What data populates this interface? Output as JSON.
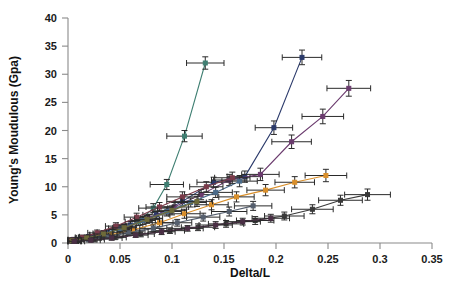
{
  "chart_data": {
    "type": "line",
    "title": "",
    "xlabel": "Delta/L",
    "ylabel": "Young's Moudulous (Gpa)",
    "xlim": [
      0,
      0.35
    ],
    "ylim": [
      0,
      40
    ],
    "xticks": [
      "0",
      "0.05",
      "0.1",
      "0.15",
      "0.2",
      "0.25",
      "0.3",
      "0.35"
    ],
    "xtick_values": [
      0,
      0.05,
      0.1,
      0.15,
      0.2,
      0.25,
      0.3,
      0.35
    ],
    "yticks": [
      "0",
      "5",
      "10",
      "15",
      "20",
      "25",
      "30",
      "35",
      "40"
    ],
    "ytick_values": [
      0,
      5,
      10,
      15,
      20,
      25,
      30,
      35,
      40
    ],
    "grid": false,
    "legend": "none",
    "error_bars": "both x and y",
    "series": [
      {
        "name": "teal-steep",
        "color": "#3f7f72",
        "marker": "cross",
        "x": [
          0.004,
          0.016,
          0.03,
          0.05,
          0.068,
          0.082,
          0.095,
          0.112,
          0.132
        ],
        "y": [
          0.5,
          0.9,
          1.4,
          2.4,
          3.8,
          6.2,
          10.4,
          19.0,
          32.0
        ],
        "xerr": [
          0.006,
          0.008,
          0.009,
          0.011,
          0.013,
          0.014,
          0.016,
          0.017,
          0.018
        ],
        "yerr": [
          0.4,
          0.4,
          0.5,
          0.6,
          0.7,
          0.8,
          0.9,
          1.0,
          1.1
        ]
      },
      {
        "name": "navy-steep",
        "color": "#2b3a6b",
        "marker": "cross",
        "x": [
          0.006,
          0.02,
          0.038,
          0.06,
          0.085,
          0.11,
          0.14,
          0.17,
          0.198,
          0.225
        ],
        "y": [
          0.6,
          1.1,
          1.9,
          3.2,
          5.0,
          7.4,
          10.8,
          11.8,
          20.5,
          33.0
        ],
        "xerr": [
          0.007,
          0.009,
          0.01,
          0.012,
          0.013,
          0.015,
          0.016,
          0.017,
          0.018,
          0.019
        ],
        "yerr": [
          0.4,
          0.4,
          0.5,
          0.6,
          0.7,
          0.8,
          0.9,
          1.0,
          1.2,
          1.3
        ]
      },
      {
        "name": "purple-mid",
        "color": "#6b3b6e",
        "marker": "cross",
        "x": [
          0.005,
          0.018,
          0.034,
          0.055,
          0.078,
          0.102,
          0.128,
          0.155,
          0.185,
          0.215,
          0.245,
          0.27
        ],
        "y": [
          0.5,
          1.0,
          1.7,
          2.8,
          4.4,
          6.4,
          8.6,
          11.2,
          12.2,
          18.0,
          22.5,
          27.5
        ],
        "xerr": [
          0.006,
          0.008,
          0.01,
          0.011,
          0.013,
          0.014,
          0.016,
          0.017,
          0.018,
          0.019,
          0.02,
          0.021
        ],
        "yerr": [
          0.4,
          0.4,
          0.5,
          0.6,
          0.7,
          0.8,
          0.9,
          1.0,
          1.1,
          1.2,
          1.3,
          1.4
        ]
      },
      {
        "name": "orange-mid",
        "color": "#d98f2b",
        "marker": "cross",
        "x": [
          0.006,
          0.022,
          0.04,
          0.062,
          0.088,
          0.112,
          0.138,
          0.162,
          0.19,
          0.218,
          0.248
        ],
        "y": [
          0.4,
          0.8,
          1.4,
          2.3,
          3.6,
          5.2,
          6.8,
          8.2,
          9.4,
          10.8,
          12.0
        ],
        "xerr": [
          0.007,
          0.009,
          0.01,
          0.012,
          0.013,
          0.015,
          0.016,
          0.017,
          0.018,
          0.019,
          0.02
        ],
        "yerr": [
          0.4,
          0.4,
          0.5,
          0.6,
          0.7,
          0.8,
          0.9,
          0.9,
          1.0,
          1.0,
          1.1
        ]
      },
      {
        "name": "darkgray-low",
        "color": "#3a3a3a",
        "marker": "cross",
        "x": [
          0.008,
          0.025,
          0.045,
          0.07,
          0.098,
          0.125,
          0.152,
          0.18,
          0.208,
          0.235,
          0.262,
          0.288
        ],
        "y": [
          0.3,
          0.6,
          1.0,
          1.6,
          2.2,
          2.8,
          3.4,
          4.0,
          4.8,
          6.0,
          7.6,
          8.6
        ],
        "xerr": [
          0.008,
          0.01,
          0.011,
          0.013,
          0.014,
          0.016,
          0.017,
          0.018,
          0.019,
          0.02,
          0.021,
          0.022
        ],
        "yerr": [
          0.4,
          0.4,
          0.4,
          0.5,
          0.5,
          0.6,
          0.6,
          0.7,
          0.7,
          0.8,
          0.9,
          1.0
        ]
      },
      {
        "name": "steelblue-low",
        "color": "#4a6b8a",
        "marker": "cross",
        "x": [
          0.004,
          0.015,
          0.03,
          0.05,
          0.072,
          0.095,
          0.118,
          0.142,
          0.165
        ],
        "y": [
          0.4,
          0.8,
          1.5,
          2.6,
          4.0,
          5.6,
          7.2,
          9.0,
          11.0
        ],
        "xerr": [
          0.006,
          0.008,
          0.009,
          0.011,
          0.012,
          0.014,
          0.015,
          0.016,
          0.017
        ],
        "yerr": [
          0.4,
          0.4,
          0.5,
          0.6,
          0.7,
          0.8,
          0.8,
          0.9,
          1.0
        ]
      },
      {
        "name": "maroon-low",
        "color": "#7a3b4a",
        "marker": "cross",
        "x": [
          0.003,
          0.014,
          0.028,
          0.046,
          0.066,
          0.088,
          0.11,
          0.133,
          0.158
        ],
        "y": [
          0.5,
          1.0,
          1.8,
          3.0,
          4.6,
          6.4,
          8.2,
          10.0,
          11.6
        ],
        "xerr": [
          0.006,
          0.007,
          0.009,
          0.01,
          0.012,
          0.013,
          0.015,
          0.016,
          0.017
        ],
        "yerr": [
          0.4,
          0.4,
          0.5,
          0.6,
          0.7,
          0.8,
          0.9,
          0.9,
          1.0
        ]
      },
      {
        "name": "slate-lowest",
        "color": "#555f6e",
        "marker": "cross",
        "x": [
          0.005,
          0.02,
          0.038,
          0.058,
          0.082,
          0.105,
          0.13,
          0.155,
          0.178
        ],
        "y": [
          0.3,
          0.6,
          1.1,
          1.8,
          2.6,
          3.6,
          4.6,
          5.6,
          6.6
        ],
        "xerr": [
          0.007,
          0.008,
          0.01,
          0.011,
          0.013,
          0.014,
          0.016,
          0.017,
          0.018
        ],
        "yerr": [
          0.3,
          0.4,
          0.4,
          0.5,
          0.6,
          0.6,
          0.7,
          0.8,
          0.8
        ]
      },
      {
        "name": "olive-low",
        "color": "#6e6b3a",
        "marker": "cross",
        "x": [
          0.004,
          0.018,
          0.034,
          0.054,
          0.076,
          0.1,
          0.124
        ],
        "y": [
          0.4,
          0.9,
          1.6,
          2.7,
          4.2,
          5.8,
          7.4
        ],
        "xerr": [
          0.006,
          0.008,
          0.009,
          0.011,
          0.012,
          0.014,
          0.015
        ],
        "yerr": [
          0.4,
          0.4,
          0.5,
          0.6,
          0.7,
          0.8,
          0.9
        ]
      },
      {
        "name": "plum-lowest",
        "color": "#4a2f45",
        "marker": "cross",
        "x": [
          0.006,
          0.022,
          0.042,
          0.065,
          0.09,
          0.115,
          0.142,
          0.168,
          0.195
        ],
        "y": [
          0.3,
          0.5,
          0.9,
          1.4,
          2.0,
          2.6,
          3.2,
          3.8,
          4.4
        ],
        "xerr": [
          0.007,
          0.009,
          0.01,
          0.012,
          0.013,
          0.015,
          0.016,
          0.017,
          0.018
        ],
        "yerr": [
          0.3,
          0.3,
          0.4,
          0.4,
          0.5,
          0.5,
          0.6,
          0.6,
          0.7
        ]
      }
    ]
  },
  "axes": {
    "x_title": "Delta/L",
    "y_title": "Young's Moudulous (Gpa)"
  }
}
